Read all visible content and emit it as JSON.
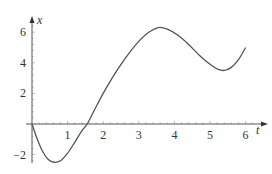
{
  "chart_data": {
    "type": "line",
    "title": "",
    "xlabel": "t",
    "ylabel": "x",
    "xlim": [
      0,
      6.6
    ],
    "ylim": [
      -2.6,
      6.5
    ],
    "grid": false,
    "legend": null,
    "x_ticks": [
      1,
      2,
      3,
      4,
      5,
      6
    ],
    "x_tick_labels": [
      "1",
      "2",
      "3",
      "4",
      "5",
      "6"
    ],
    "y_ticks": [
      -2,
      2,
      4,
      6
    ],
    "y_tick_labels": [
      "−2",
      "2",
      "4",
      "6"
    ],
    "series": [
      {
        "name": "x(t)",
        "color": "#555555",
        "x": [
          0,
          0.15,
          0.3,
          0.45,
          0.62,
          0.8,
          1.0,
          1.2,
          1.4,
          1.55,
          1.75,
          2.0,
          2.25,
          2.5,
          2.75,
          3.0,
          3.25,
          3.55,
          3.8,
          4.1,
          4.4,
          4.7,
          5.0,
          5.2,
          5.4,
          5.6,
          5.8,
          6.0
        ],
        "values": [
          0,
          -1.0,
          -1.8,
          -2.3,
          -2.5,
          -2.4,
          -1.9,
          -1.2,
          -0.45,
          0.0,
          0.9,
          2.0,
          3.0,
          3.9,
          4.7,
          5.4,
          5.95,
          6.3,
          6.2,
          5.8,
          5.2,
          4.5,
          3.9,
          3.6,
          3.5,
          3.7,
          4.2,
          5.0
        ]
      }
    ],
    "axes_style": "cross through origin with arrowheads"
  }
}
